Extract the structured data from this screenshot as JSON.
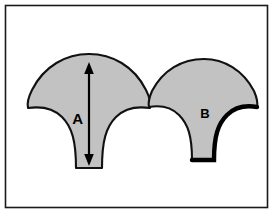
{
  "figure": {
    "background_color": "#ffffff",
    "frame": {
      "name": "border-frame",
      "stroke_color": "#1a1a1a",
      "x": 5.5,
      "y": 5.5,
      "width": 262,
      "height": 202
    },
    "shape_fill_color": "#c2c2c2",
    "shape_stroke_color": "#111111",
    "shapes": [
      {
        "id": "A",
        "label": "A",
        "name": "fan-shape-a",
        "path": "M 89 54 C 112 54 134 66 146 90 C 150 98 151 104 150 108 C 136 106 124 109 116 117 C 106 127 102 141 102 168 L 76 168 C 76 141 72 127 62 117 C 54 109 42 106 28 108 C 27 104 28 98 32 90 C 44 66 66 54 89 54 Z",
        "heavy_edge": false
      },
      {
        "id": "B",
        "label": "B",
        "name": "fan-shape-b",
        "path": "M 204 59 C 224 59 243 70 254 91 C 257 98 258 103 257 107 C 245 105 234 108 227 115 C 218 124 214 136 214 160 L 192 160 C 192 136 188 124 179 115 C 172 108 161 105 149 107 C 148 103 149 98 152 91 C 163 70 182 59 204 59 Z",
        "heavy_edge": true,
        "heavy_edge_path": "M 257 107 C 245 105 234 108 227 115 C 218 124 214 136 214 160 L 192 160",
        "heavy_edge_color": "#000000"
      }
    ],
    "dimension_arrow": {
      "name": "dimension-arrow-a",
      "label": "A",
      "orientation": "vertical",
      "double_headed": true,
      "x": 89,
      "y_top": 66,
      "y_bottom": 162,
      "label_x": 76,
      "label_y": 119,
      "color": "#000000"
    },
    "shape_label_positions": [
      {
        "id": "A",
        "x": 76,
        "y": 119
      },
      {
        "id": "B",
        "x": 205,
        "y": 113
      }
    ]
  }
}
